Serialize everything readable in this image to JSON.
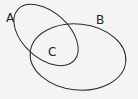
{
  "diagram": {
    "type": "venn",
    "sets": [
      {
        "id": "A",
        "label": "A"
      },
      {
        "id": "B",
        "label": "B"
      }
    ],
    "intersection": {
      "label": "C",
      "of": [
        "A",
        "B"
      ]
    },
    "colors": {
      "stroke": "#2a2a2a",
      "background": "#f4f4f2",
      "text": "#222222"
    }
  }
}
